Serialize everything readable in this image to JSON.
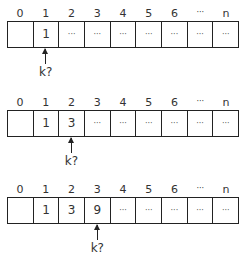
{
  "diagrams": [
    {
      "indices": [
        "0",
        "1",
        "2",
        "3",
        "4",
        "5",
        "6",
        "···",
        "n"
      ],
      "cells": [
        "",
        "1",
        "···",
        "···",
        "···",
        "···",
        "···",
        "···",
        "···"
      ],
      "pointer_index": 1,
      "pointer_label": "k?"
    },
    {
      "indices": [
        "0",
        "1",
        "2",
        "3",
        "4",
        "5",
        "6",
        "···",
        "n"
      ],
      "cells": [
        "",
        "1",
        "3",
        "···",
        "···",
        "···",
        "···",
        "···",
        "···"
      ],
      "pointer_index": 2,
      "pointer_label": "k?"
    },
    {
      "indices": [
        "0",
        "1",
        "2",
        "3",
        "4",
        "5",
        "6",
        "···",
        "n"
      ],
      "cells": [
        "",
        "1",
        "3",
        "9",
        "···",
        "···",
        "···",
        "···",
        "···"
      ],
      "pointer_index": 3,
      "pointer_label": "k?"
    }
  ],
  "colors": {
    "line": "#222222",
    "text": "#333333",
    "background": "#ffffff"
  }
}
